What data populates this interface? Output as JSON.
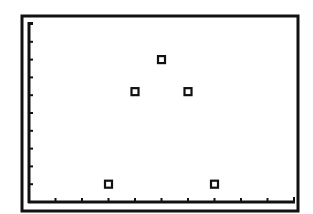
{
  "screen": {
    "background": "#ffffff",
    "ink": "#111111"
  },
  "chart_data": {
    "type": "scatter",
    "title": "",
    "xlabel": "",
    "ylabel": "",
    "x": [
      3,
      4,
      5,
      6,
      7
    ],
    "y": [
      1,
      6.2,
      8,
      6.2,
      1
    ],
    "marker": "hollow-square",
    "xlim": [
      0,
      10.3
    ],
    "ylim": [
      0,
      10
    ],
    "x_ticks": [
      1,
      2,
      3,
      4,
      5,
      6,
      7,
      8,
      9,
      10
    ],
    "y_ticks": [
      1,
      2,
      3,
      4,
      5,
      6,
      7,
      8,
      9,
      10
    ],
    "tick_labels_shown": false,
    "grid": false,
    "legend": null
  }
}
